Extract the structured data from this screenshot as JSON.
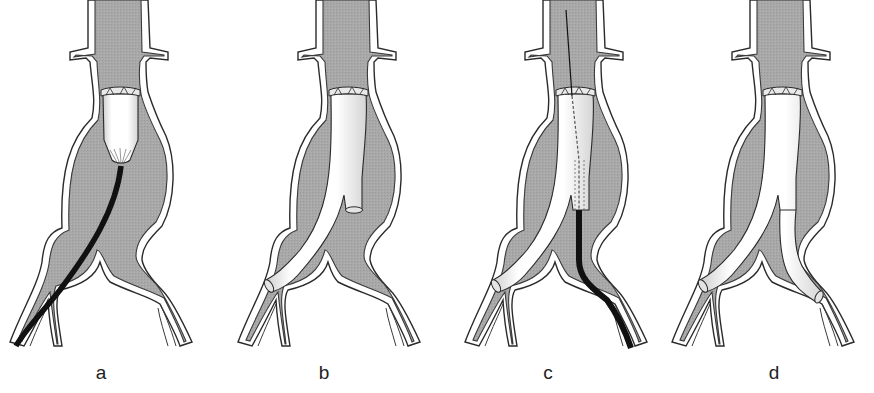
{
  "figure": {
    "colors": {
      "vessel_lumen": "#a9a9a9",
      "vessel_wall": "#ffffff",
      "outline": "#2a2a2a",
      "graft": "#f6f6f6",
      "catheter": "#111111",
      "background": "#ffffff"
    },
    "panels": [
      {
        "id": "a",
        "label": "a",
        "offset_x": 0,
        "stage": "main body delivery system inserted via left iliac, graft partially deployed below renal arteries"
      },
      {
        "id": "b",
        "label": "b",
        "offset_x": 228,
        "stage": "main body deployed with ipsilateral limb and short contralateral gate"
      },
      {
        "id": "c",
        "label": "c",
        "offset_x": 455,
        "stage": "guidewire cannulates contralateral gate; contralateral limb delivery catheter advanced from right iliac"
      },
      {
        "id": "d",
        "label": "d",
        "offset_x": 662,
        "stage": "contralateral limb deployed; complete bifurcated stent-graft"
      }
    ]
  }
}
